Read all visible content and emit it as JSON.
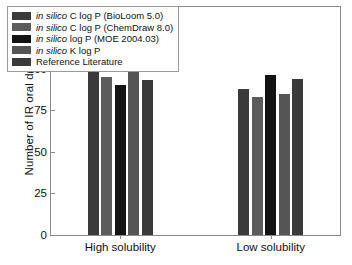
{
  "chart_data": {
    "type": "bar",
    "title": "",
    "xlabel": "",
    "ylabel": "Number of IR oral drugs",
    "categories": [
      "High solubility",
      "Low solubility"
    ],
    "ylim": [
      0,
      137
    ],
    "yticks": [
      0,
      25,
      50,
      75,
      100,
      125
    ],
    "ytick_labels": [
      "0",
      "25",
      "50",
      "75",
      "100",
      "125"
    ],
    "grid": false,
    "legend_position": "upper left",
    "series": [
      {
        "name": "in silico C log P (BioLoom 5.0)",
        "name_parts": {
          "italic": "in silico",
          "rest": " C log P (BioLoom 5.0)"
        },
        "color": "#3a3a3a",
        "values": [
          99,
          88
        ]
      },
      {
        "name": "in silico C log P (ChemDraw 8.0)",
        "name_parts": {
          "italic": "in silico",
          "rest": " C log P (ChemDraw 8.0)"
        },
        "color": "#5c5c5c",
        "values": [
          95,
          83
        ]
      },
      {
        "name": "in silico log P (MOE 2004.03)",
        "name_parts": {
          "italic": "in silico",
          "rest": " log P (MOE 2004.03)"
        },
        "color": "#131313",
        "values": [
          90,
          96
        ]
      },
      {
        "name": "in silico K log P",
        "name_parts": {
          "italic": "in silico",
          "rest": " K log P"
        },
        "color": "#555555",
        "values": [
          101,
          85
        ]
      },
      {
        "name": "Reference Literature",
        "name_parts": {
          "italic": "",
          "rest": "Reference Literature"
        },
        "color": "#3a3a3a",
        "values": [
          93,
          94
        ]
      }
    ]
  }
}
